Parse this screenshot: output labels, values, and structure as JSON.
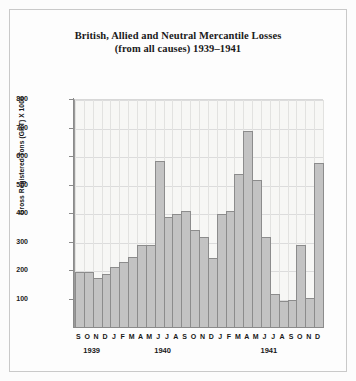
{
  "title": {
    "line1": "British, Allied and Neutral Mercantile Losses",
    "line2": "(from all causes) 1939–1941"
  },
  "chart_data": {
    "type": "bar",
    "xlabel": "",
    "ylabel": "Gross Registered Tons (GRT) X 1000",
    "ylim": [
      0,
      800
    ],
    "yticks": [
      100,
      200,
      300,
      400,
      500,
      600,
      700,
      800
    ],
    "grid": true,
    "legend": null,
    "categories": [
      "S",
      "O",
      "N",
      "D",
      "J",
      "F",
      "M",
      "A",
      "M",
      "J",
      "J",
      "A",
      "S",
      "O",
      "N",
      "D",
      "J",
      "F",
      "M",
      "A",
      "M",
      "J",
      "J",
      "A",
      "S",
      "O",
      "N",
      "D"
    ],
    "year_groups": [
      {
        "label": "1939",
        "start_index": 0,
        "count": 4
      },
      {
        "label": "1940",
        "start_index": 4,
        "count": 12
      },
      {
        "label": "1941",
        "start_index": 16,
        "count": 12
      }
    ],
    "values": [
      195,
      195,
      175,
      190,
      215,
      230,
      250,
      290,
      290,
      585,
      390,
      400,
      410,
      345,
      320,
      245,
      400,
      410,
      540,
      690,
      520,
      320,
      120,
      95,
      100,
      290,
      105,
      580
    ],
    "bar_color": "#c3c3c3",
    "bar_edge_color": "#8c8c8c"
  },
  "axis": {
    "y_tick_labels": [
      "800",
      "700",
      "600",
      "500",
      "400",
      "300",
      "200",
      "100"
    ],
    "y_title": "Gross Registered Tons (GRT) X 1000"
  }
}
